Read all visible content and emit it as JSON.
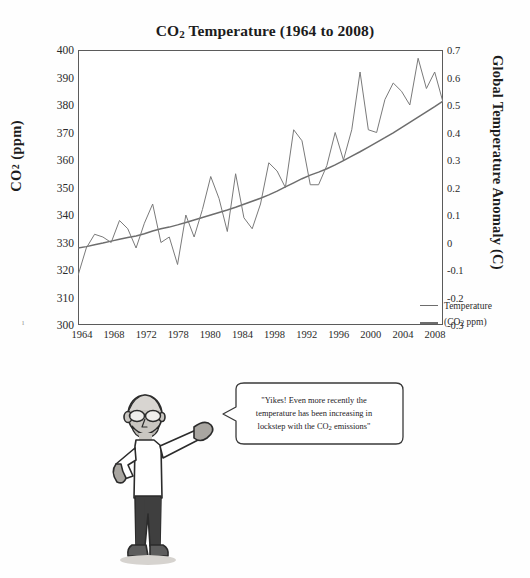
{
  "chart_data": {
    "type": "line",
    "title_parts": {
      "pre": "CO",
      "sub": "2",
      "post": " Temperature (1964 to 2008)"
    },
    "xlabel": "",
    "ylabel_left": "CO₂ (ppm)",
    "ylabel_left_parts": {
      "pre": "CO",
      "sub": "2",
      "post": " (ppm)"
    },
    "ylabel_right": "Global Temperature Anomaly (C)",
    "ylim_left": [
      300,
      400
    ],
    "ylim_right": [
      -0.3,
      0.7
    ],
    "ytick_step_left": 10,
    "ytick_step_right": 0.1,
    "yticks_left": [
      "400",
      "390",
      "380",
      "370",
      "360",
      "350",
      "340",
      "330",
      "320",
      "310",
      "300"
    ],
    "yticks_right": [
      "0.7",
      "0.6",
      "0.5",
      "0.4",
      "0.3",
      "0.2",
      "0.1",
      "0",
      "-0.1",
      "-0.2",
      "-0.3"
    ],
    "xticks": [
      "1964",
      "1968",
      "1972",
      "1978",
      "1980",
      "1984",
      "1998",
      "1992",
      "1996",
      "2000",
      "2004",
      "2008"
    ],
    "xlim": [
      1964,
      2008
    ],
    "grid": false,
    "legend_position": "inside-lower-right",
    "legend": [
      {
        "name": "Temperature",
        "axis": "right",
        "color": "#6d6d6d"
      },
      {
        "name": "(CO₂ ppm)",
        "axis": "left",
        "color": "#6d6d6d",
        "parts": {
          "pre": "(CO",
          "sub": "2",
          "post": " ppm)"
        }
      }
    ],
    "series": [
      {
        "name": "(CO2 ppm)",
        "axis": "left",
        "unit": "ppm",
        "x": [
          1964,
          1965,
          1966,
          1967,
          1968,
          1969,
          1970,
          1971,
          1972,
          1973,
          1974,
          1975,
          1976,
          1977,
          1978,
          1979,
          1980,
          1981,
          1982,
          1983,
          1984,
          1985,
          1986,
          1987,
          1988,
          1989,
          1990,
          1991,
          1992,
          1993,
          1994,
          1995,
          1996,
          1997,
          1998,
          1999,
          2000,
          2001,
          2002,
          2003,
          2004,
          2005,
          2006,
          2007,
          2008
        ],
        "values": [
          328.0,
          328.5,
          329.2,
          329.8,
          330.5,
          331.2,
          331.8,
          332.4,
          333.2,
          334.2,
          335.0,
          335.6,
          336.4,
          337.3,
          338.2,
          339.1,
          340.0,
          340.9,
          341.8,
          342.8,
          343.9,
          345.0,
          346.1,
          347.3,
          348.7,
          350.2,
          351.7,
          353.2,
          354.5,
          355.6,
          356.8,
          358.2,
          359.8,
          361.4,
          363.0,
          364.7,
          366.4,
          368.1,
          369.9,
          371.8,
          373.7,
          375.6,
          377.5,
          379.4,
          381.4
        ]
      },
      {
        "name": "Temperature",
        "axis": "right",
        "unit": "C",
        "x": [
          1964,
          1965,
          1966,
          1967,
          1968,
          1969,
          1970,
          1971,
          1972,
          1973,
          1974,
          1975,
          1976,
          1977,
          1978,
          1979,
          1980,
          1981,
          1982,
          1983,
          1984,
          1985,
          1986,
          1987,
          1988,
          1989,
          1990,
          1991,
          1992,
          1993,
          1994,
          1995,
          1996,
          1997,
          1998,
          1999,
          2000,
          2001,
          2002,
          2003,
          2004,
          2005,
          2006,
          2007,
          2008
        ],
        "values": [
          -0.12,
          -0.02,
          0.03,
          0.02,
          0.0,
          0.08,
          0.05,
          -0.02,
          0.07,
          0.14,
          0.0,
          0.02,
          -0.08,
          0.1,
          0.02,
          0.12,
          0.24,
          0.16,
          0.04,
          0.25,
          0.09,
          0.05,
          0.14,
          0.29,
          0.26,
          0.2,
          0.41,
          0.37,
          0.21,
          0.21,
          0.28,
          0.4,
          0.3,
          0.41,
          0.62,
          0.41,
          0.4,
          0.52,
          0.58,
          0.55,
          0.5,
          0.67,
          0.56,
          0.62,
          0.51
        ]
      }
    ]
  },
  "cartoon": {
    "speech_text": "\"Yikes! Even more recently the temperature has been increasing in lockstep with the CO₂ emissions\"",
    "speech_lines": [
      "\"Yikes! Even more recently the",
      "temperature has been increasing in",
      "lockstep with the CO₂ emissions\""
    ],
    "speech_line3_parts": {
      "pre": "lockstep with the CO",
      "sub": "2",
      "post": " emissions\""
    },
    "character": "man-pointing-with-glasses-and-beard",
    "colors": {
      "skin": "#b9b6b1",
      "shirt": "#ffffff",
      "pants": "#3f3f3f",
      "shoes": "#5a5a5a",
      "outline": "#2b2b2b"
    }
  },
  "style": {
    "line_color": "#6d6d6d",
    "frame_color": "#5b5b5b",
    "text_color": "#1c1c1c",
    "background": "#ffffff"
  }
}
